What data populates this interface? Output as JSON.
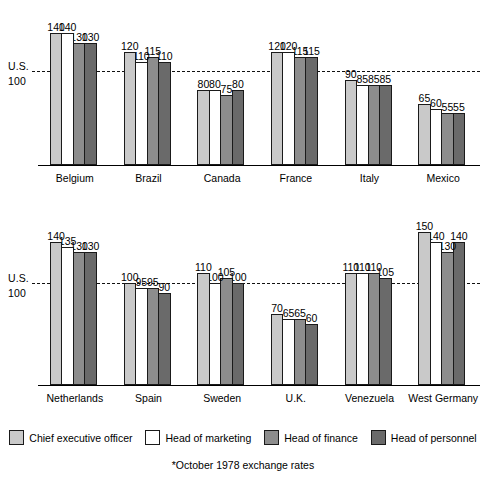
{
  "chart_data": {
    "type": "bar",
    "title": "",
    "subtitle": "",
    "xlabel": "",
    "ylabel": "",
    "ylim": [
      0,
      160
    ],
    "grid": false,
    "legend_position": "bottom",
    "reference_line": {
      "value": 100,
      "label_line1": "U.S.",
      "label_line2": "100",
      "style": "dashed"
    },
    "categories": [
      "Belgium",
      "Brazil",
      "Canada",
      "France",
      "Italy",
      "Mexico",
      "Netherlands",
      "Spain",
      "Sweden",
      "U.K.",
      "Venezuela",
      "West Germany"
    ],
    "series": [
      {
        "name": "Chief executive officer",
        "color": "#c9c9c9",
        "values": [
          140,
          120,
          80,
          120,
          90,
          65,
          140,
          100,
          110,
          70,
          110,
          150
        ]
      },
      {
        "name": "Head of marketing",
        "color": "#ffffff",
        "values": [
          140,
          110,
          80,
          120,
          85,
          60,
          135,
          95,
          100,
          65,
          110,
          140
        ]
      },
      {
        "name": "Head of finance",
        "color": "#8d8d8d",
        "values": [
          130,
          115,
          75,
          115,
          85,
          55,
          130,
          95,
          105,
          65,
          110,
          130
        ]
      },
      {
        "name": "Head of personnel",
        "color": "#6a6a6a",
        "values": [
          130,
          110,
          80,
          115,
          85,
          55,
          130,
          90,
          100,
          60,
          105,
          140
        ]
      }
    ],
    "annotations": [
      "*October 1978 exchange rates"
    ]
  },
  "legend": {
    "items": [
      {
        "label": "Chief executive officer",
        "color": "#c9c9c9"
      },
      {
        "label": "Head of marketing",
        "color": "#ffffff"
      },
      {
        "label": "Head of finance",
        "color": "#8d8d8d"
      },
      {
        "label": "Head of personnel",
        "color": "#6a6a6a"
      }
    ]
  },
  "footnote": {
    "text": "*October 1978 exchange rates"
  },
  "rows": [
    {
      "us_label_line1": "U.S.",
      "us_label_line2": "100",
      "categories": [
        "Belgium",
        "Brazil",
        "Canada",
        "France",
        "Italy",
        "Mexico"
      ]
    },
    {
      "us_label_line1": "U.S.",
      "us_label_line2": "100",
      "categories": [
        "Netherlands",
        "Spain",
        "Sweden",
        "U.K.",
        "Venezuela",
        "West Germany"
      ]
    }
  ]
}
